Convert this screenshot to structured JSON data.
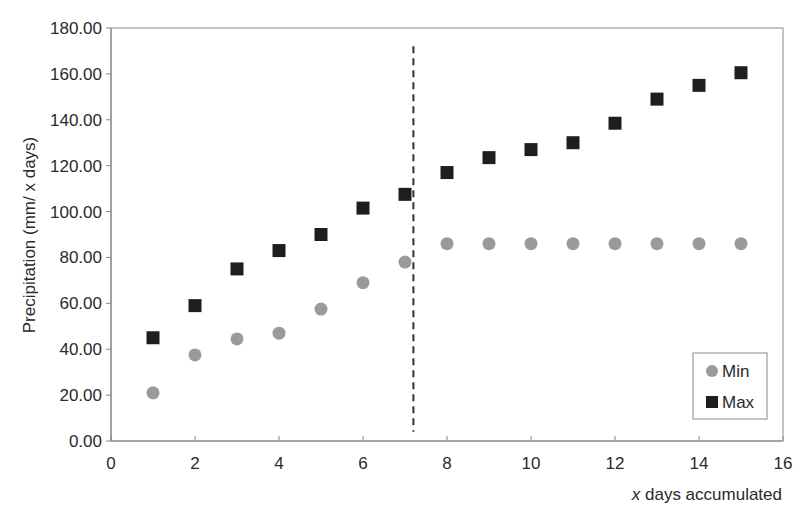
{
  "chart_data": {
    "type": "scatter",
    "title": "",
    "xlabel_italic": "x",
    "xlabel_rest": " days accumulated",
    "xlabel": "x days accumulated",
    "ylabel": "Precipitation (mm/ x days)",
    "xlim": [
      0,
      16
    ],
    "ylim": [
      0,
      180
    ],
    "x_ticks": [
      "0",
      "2",
      "4",
      "6",
      "8",
      "10",
      "12",
      "14",
      "16"
    ],
    "x_tick_values": [
      0,
      2,
      4,
      6,
      8,
      10,
      12,
      14,
      16
    ],
    "y_ticks": [
      "0.00",
      "20.00",
      "40.00",
      "60.00",
      "80.00",
      "100.00",
      "120.00",
      "140.00",
      "160.00",
      "180.00"
    ],
    "y_tick_values": [
      0,
      20,
      40,
      60,
      80,
      100,
      120,
      140,
      160,
      180
    ],
    "grid": false,
    "legend_position": "lower right",
    "x": [
      1,
      2,
      3,
      4,
      5,
      6,
      7,
      8,
      9,
      10,
      11,
      12,
      13,
      14,
      15
    ],
    "series": [
      {
        "name": "Min",
        "marker": "circle",
        "color": "#9a9a9a",
        "values": [
          21,
          37.5,
          44.5,
          47,
          57.5,
          69,
          78,
          86,
          86,
          86,
          86,
          86,
          86,
          86,
          86
        ]
      },
      {
        "name": "Max",
        "marker": "square",
        "color": "#1e1e1e",
        "values": [
          45,
          59,
          75,
          83,
          90,
          101.5,
          107.5,
          117,
          123.5,
          127,
          130,
          138.5,
          149,
          155,
          160.5
        ]
      }
    ],
    "annotations": [
      {
        "type": "vertical-dashed-line",
        "x": 7.2,
        "y_from": 4,
        "y_to": 172
      }
    ]
  },
  "colors": {
    "axis": "#8a8a8a",
    "min_marker": "#9a9a9a",
    "max_marker": "#1e1e1e",
    "dashed_line": "#333333"
  }
}
